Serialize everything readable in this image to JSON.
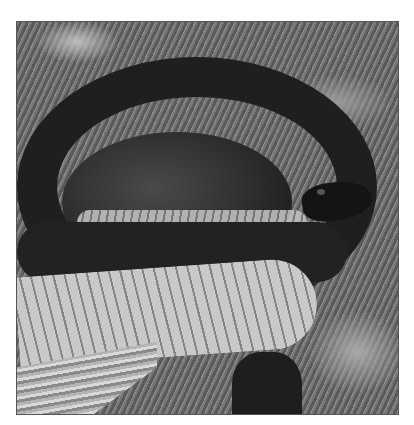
{
  "image": {
    "subject": "coiled black snake on dry grass and pine needles",
    "style": "grayscale photograph with thin dark border",
    "colors": {
      "background": "#ffffff",
      "border": "#555555",
      "snake_dorsal": "#1f1f1f",
      "snake_belly": "#bfbfbf",
      "ground": "#6a6a6a"
    }
  }
}
